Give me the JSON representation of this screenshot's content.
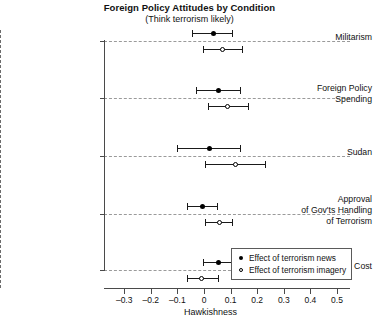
{
  "chart_data": {
    "type": "scatter",
    "title": "Foreign Policy Attitudes by Condition",
    "subtitle": "(Think terrorism likely)",
    "xlabel": "Hawkishness",
    "ylabel": "",
    "xlim": [
      -0.35,
      0.55
    ],
    "xticks": [
      -0.3,
      -0.2,
      -0.1,
      0,
      0.1,
      0.2,
      0.3,
      0.4,
      0.5
    ],
    "xticklabels": [
      "–0.3",
      "–0.2",
      "–0.1",
      "0",
      "0.1",
      "0.2",
      "0.3",
      "0.4",
      "0.5"
    ],
    "grid": "horizontal-dashed-per-category",
    "reference_line": 0,
    "legend_position": "bottom-right",
    "categories": [
      "Militarism",
      "Foreign Policy Spending",
      "Sudan",
      "Approval of Gov'ts Handling of Terrorism",
      "Iraq Worth Cost"
    ],
    "category_label_lines": [
      [
        "Militarism"
      ],
      [
        "Foreign Policy",
        "Spending"
      ],
      [
        "Sudan"
      ],
      [
        "Approval",
        "of Gov'ts Handling",
        "of Terrorism"
      ],
      [
        "Iraq Worth Cost"
      ]
    ],
    "series": [
      {
        "name": "Effect of terrorism news",
        "marker": "filled-circle",
        "values": [
          0.034,
          0.056,
          0.019,
          -0.004,
          0.053
        ],
        "ci_low": [
          -0.045,
          -0.03,
          -0.101,
          -0.064,
          -0.004
        ],
        "ci_high": [
          0.105,
          0.135,
          0.135,
          0.049,
          0.109
        ]
      },
      {
        "name": "Effect of terrorism imagery",
        "marker": "open-circle",
        "values": [
          0.068,
          0.09,
          0.117,
          0.06,
          -0.008
        ],
        "ci_low": [
          -0.004,
          0.015,
          0.004,
          0.004,
          -0.064
        ],
        "ci_high": [
          0.143,
          0.165,
          0.229,
          0.105,
          0.053
        ]
      }
    ]
  },
  "legend": {
    "items": [
      {
        "label": "Effect of terrorism news",
        "marker": "filled-circle"
      },
      {
        "label": "Effect of terrorism imagery",
        "marker": "open-circle"
      }
    ]
  }
}
